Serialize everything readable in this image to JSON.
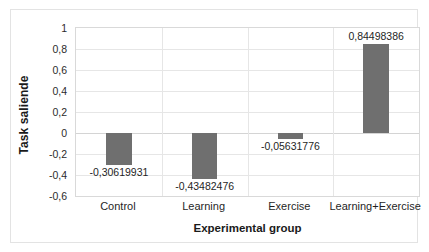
{
  "chart_data": {
    "type": "bar",
    "title": "",
    "categories": [
      "Control",
      "Learning",
      "Exercise",
      "Learning+Exercise"
    ],
    "values": [
      -0.30619931,
      -0.43482476,
      -0.05631776,
      0.84498386
    ],
    "data_labels": [
      "-0,30619931",
      "-0,43482476",
      "-0,05631776",
      "0,84498386"
    ],
    "xlabel": "Experimental group",
    "ylabel": "Task saliende",
    "ylim": [
      -0.6,
      1.0
    ],
    "ytick_values": [
      1,
      0.8,
      0.6,
      0.4,
      0.2,
      0,
      -0.2,
      -0.4,
      -0.6
    ],
    "ytick_labels": [
      "1",
      "0,8",
      "0,6",
      "0,4",
      "0,2",
      "0",
      "-0,2",
      "-0,4",
      "-0,6"
    ],
    "grid": true,
    "legend": "none",
    "bar_color": "#6f6f6f",
    "gridline_color": "#e6e6e6",
    "plot_border_color": "#d9d9d9",
    "figure_border_color": "#e3e3e3",
    "text_color": "#1f1f1f",
    "decimal_separator": ","
  }
}
